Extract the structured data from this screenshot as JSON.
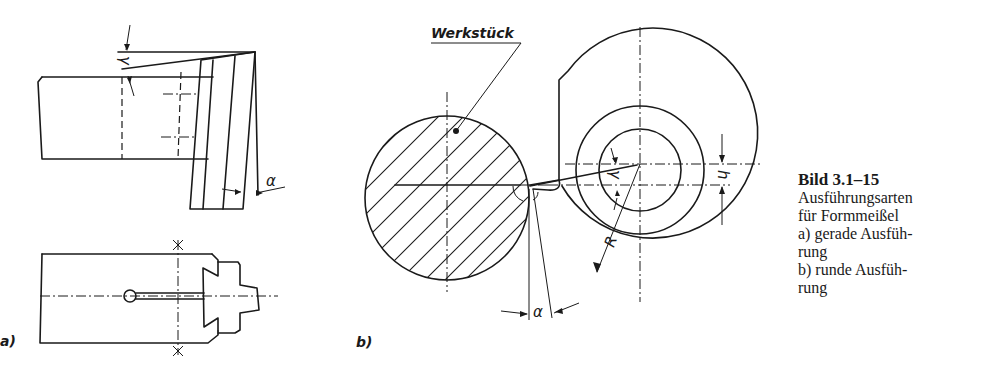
{
  "figure": {
    "labels": {
      "panel_a": "a)",
      "panel_b": "b)",
      "workpiece": "Werkstück",
      "rake_angle": "γ",
      "clearance_angle": "α",
      "radius": "R",
      "height": "h"
    },
    "caption": {
      "title": "Bild 3.1–15",
      "lines": [
        "Ausführungsarten",
        "für Formmeißel",
        "a)  gerade Ausfüh-",
        "rung",
        "b)  runde Ausfüh-",
        "rung"
      ]
    },
    "colors": {
      "line": "#1a1a1a",
      "background": "#ffffff"
    }
  }
}
